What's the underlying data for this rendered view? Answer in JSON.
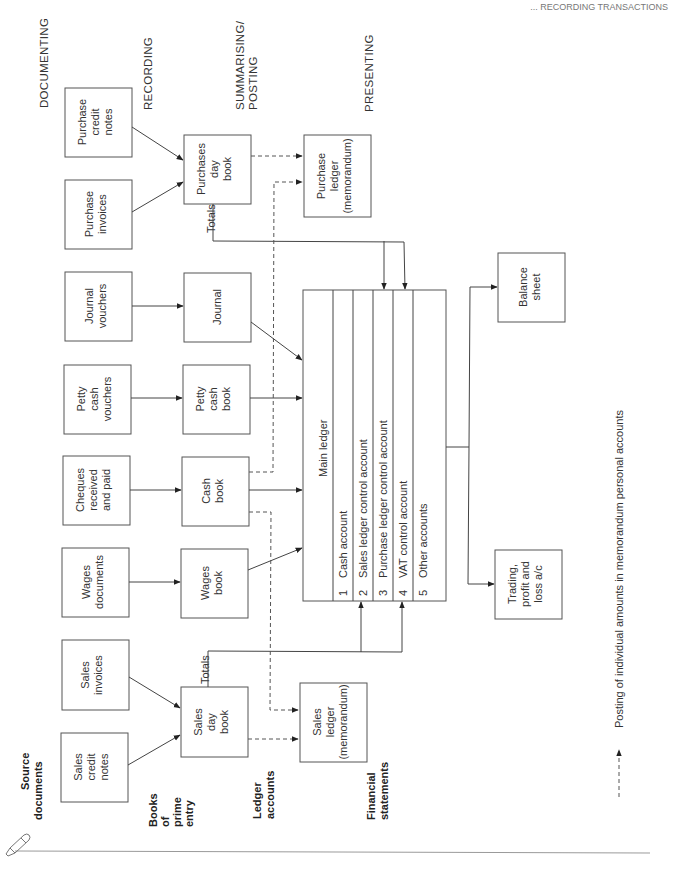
{
  "header_cut": "... RECORDING TRANSACTIONS",
  "stages": {
    "documenting": "DOCUMENTING",
    "recording": "RECORDING",
    "summarising": [
      "SUMMARISING/",
      "POSTING"
    ],
    "presenting": "PRESENTING"
  },
  "row_labels": {
    "source_documents": [
      "Source",
      "documents"
    ],
    "books_of_prime_entry": [
      "Books",
      "of",
      "prime",
      "entry"
    ],
    "ledger_accounts": [
      "Ledger",
      "accounts"
    ],
    "financial_statements": [
      "Financial",
      "statements"
    ]
  },
  "source_documents": {
    "purchase_credit_notes": [
      "Purchase",
      "credit",
      "notes"
    ],
    "purchase_invoices": [
      "Purchase",
      "invoices"
    ],
    "journal_vouchers": [
      "Journal",
      "vouchers"
    ],
    "petty_cash_vouchers": [
      "Petty",
      "cash",
      "vouchers"
    ],
    "cheques": [
      "Cheques",
      "received",
      "and paid"
    ],
    "wages_documents": [
      "Wages",
      "documents"
    ],
    "sales_invoices": [
      "Sales",
      "invoices"
    ],
    "sales_credit_notes": [
      "Sales",
      "credit",
      "notes"
    ]
  },
  "books": {
    "purchases_day_book": [
      "Purchases",
      "day",
      "book"
    ],
    "journal": [
      "Journal"
    ],
    "petty_cash_book": [
      "Petty",
      "cash",
      "book"
    ],
    "cash_book": [
      "Cash",
      "book"
    ],
    "wages_book": [
      "Wages",
      "book"
    ],
    "sales_day_book": [
      "Sales",
      "day",
      "book"
    ]
  },
  "totals_label": "Totals",
  "ledgers": {
    "purchase_ledger": [
      "Purchase",
      "ledger",
      "(memorandum)"
    ],
    "sales_ledger": [
      "Sales",
      "ledger",
      "(memorandum)"
    ]
  },
  "main_ledger": {
    "title": "Main ledger",
    "accounts": [
      {
        "num": "1",
        "name": "Cash account"
      },
      {
        "num": "2",
        "name": "Sales ledger control account"
      },
      {
        "num": "3",
        "name": "Purchase ledger control account"
      },
      {
        "num": "4",
        "name": "VAT control account"
      },
      {
        "num": "5",
        "name": "Other accounts"
      }
    ]
  },
  "statements": {
    "balance_sheet": [
      "Balance",
      "sheet"
    ],
    "trading_pl": [
      "Trading,",
      "profit and",
      "loss a/c"
    ]
  },
  "legend": {
    "text": "Posting of individual amounts in memorandum personal accounts",
    "style": "dashed-arrow"
  }
}
